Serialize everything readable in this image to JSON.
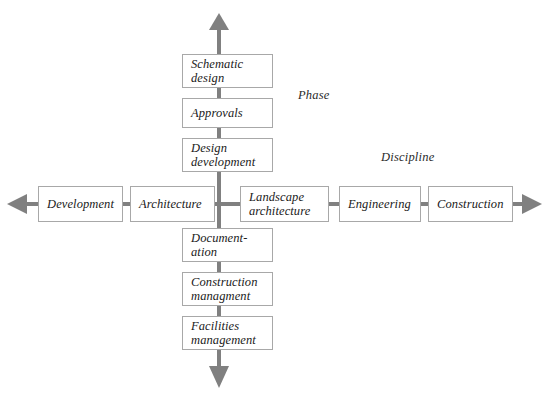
{
  "diagram": {
    "type": "cross-axis-matrix",
    "title_visible": false,
    "colors": {
      "line": "#808080",
      "box_border": "#a8a8a8",
      "box_fill": "#ffffff",
      "text": "#1a1a1a",
      "background": "#ffffff"
    },
    "axis_labels": [
      {
        "name": "phase-axis-label",
        "text": "Phase",
        "x": 298,
        "y": 88
      },
      {
        "name": "discipline-axis-label",
        "text": "Discipline",
        "x": 381,
        "y": 150
      }
    ],
    "vertical_axis": {
      "name": "phase-axis",
      "orientation": "vertical",
      "arrow_top": true,
      "arrow_bottom": true,
      "center_x": 219,
      "top_y": 15,
      "bottom_y": 386,
      "nodes": [
        {
          "name": "node-schematic-design",
          "text": "Schematic\ndesign",
          "x": 182,
          "y": 54,
          "w": 91,
          "h": 34
        },
        {
          "name": "node-approvals",
          "text": "Approvals",
          "x": 182,
          "y": 98,
          "w": 91,
          "h": 30
        },
        {
          "name": "node-design-development",
          "text": "Design\ndevelopment",
          "x": 182,
          "y": 138,
          "w": 91,
          "h": 34
        },
        {
          "name": "node-documentation",
          "text": "Document-\nation",
          "x": 182,
          "y": 228,
          "w": 91,
          "h": 34
        },
        {
          "name": "node-construction-managment",
          "text": "Construction\nmanagment",
          "x": 182,
          "y": 272,
          "w": 91,
          "h": 34
        },
        {
          "name": "node-facilities-management",
          "text": "Facilities\nmanagement",
          "x": 182,
          "y": 316,
          "w": 91,
          "h": 34
        }
      ]
    },
    "horizontal_axis": {
      "name": "discipline-axis",
      "orientation": "horizontal",
      "arrow_left": true,
      "arrow_right": true,
      "center_y": 204,
      "left_x": 8,
      "right_x": 541,
      "nodes": [
        {
          "name": "node-development",
          "text": "Development",
          "x": 38,
          "y": 186,
          "w": 85,
          "h": 36
        },
        {
          "name": "node-architecture",
          "text": "Architecture",
          "x": 130,
          "y": 186,
          "w": 85,
          "h": 36
        },
        {
          "name": "node-landscape-architecture",
          "text": "Landscape\narchitecture",
          "x": 240,
          "y": 186,
          "w": 89,
          "h": 36
        },
        {
          "name": "node-engineering",
          "text": "Engineering",
          "x": 339,
          "y": 186,
          "w": 82,
          "h": 36
        },
        {
          "name": "node-construction",
          "text": "Construction",
          "x": 428,
          "y": 186,
          "w": 85,
          "h": 36
        }
      ]
    }
  }
}
